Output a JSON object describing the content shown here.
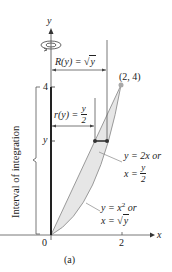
{
  "figure": {
    "caption": "(a)",
    "axes": {
      "x_label": "x",
      "y_label": "y",
      "x_ticks": [
        {
          "value": 0,
          "label": "0"
        },
        {
          "value": 2,
          "label": "2"
        }
      ],
      "y_ticks": [
        {
          "value": 4,
          "label": "4"
        },
        {
          "value": "y",
          "label": "y"
        }
      ]
    },
    "rotation_icon": "rotation-arrow-icon",
    "point_label": "(2, 4)",
    "outer_radius": {
      "prefix": "R(y) = ",
      "radical": "√",
      "radicand": "y"
    },
    "inner_radius": {
      "prefix": "r(y) = ",
      "numerator": "y",
      "denominator": "2"
    },
    "curve_line": {
      "line1": "y = 2x or",
      "line2_prefix": "x = ",
      "numerator": "y",
      "denominator": "2"
    },
    "curve_parabola": {
      "line1_prefix": "y = x",
      "exponent": "2",
      "line1_suffix": " or",
      "line2_prefix": "x = ",
      "radical": "√",
      "radicand": "y"
    },
    "interval_label": "Interval of integration",
    "colors": {
      "region_fill": "#e6e6e6",
      "curve_stroke": "#9a9a9a",
      "axis": "#333333",
      "point": "#a8a8a8",
      "washer": "#333333"
    }
  }
}
